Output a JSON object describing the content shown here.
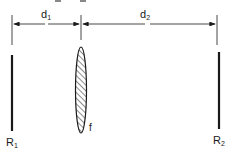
{
  "diagram": {
    "top_clipped_text": "d₁ d₂",
    "dimensions": [
      {
        "id": "d1",
        "label": "d",
        "subscript": "1"
      },
      {
        "id": "d2",
        "label": "d",
        "subscript": "2"
      }
    ],
    "elements": [
      {
        "id": "mirror1",
        "label": "R",
        "subscript": "1"
      },
      {
        "id": "lens",
        "label": "f"
      },
      {
        "id": "mirror2",
        "label": "R",
        "subscript": "2"
      }
    ],
    "colors": {
      "ink": "#1a1a1a",
      "background": "#ffffff"
    }
  }
}
